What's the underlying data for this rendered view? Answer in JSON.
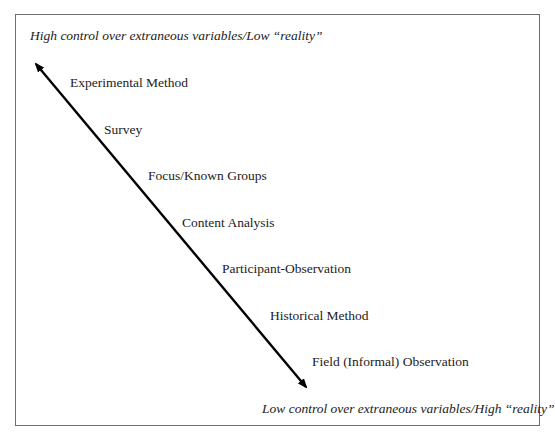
{
  "diagram": {
    "top_label": "High control over extraneous variables/Low “reality”",
    "bottom_label": "Low control over extraneous variables/High “reality”",
    "arrow": {
      "direction": "bidirectional",
      "color": "#000000"
    },
    "methods": [
      {
        "label": "Experimental Method"
      },
      {
        "label": "Survey"
      },
      {
        "label": "Focus/Known Groups"
      },
      {
        "label": "Content Analysis"
      },
      {
        "label": "Participant-Observation"
      },
      {
        "label": "Historical Method"
      },
      {
        "label": "Field (Informal) Observation"
      }
    ]
  }
}
